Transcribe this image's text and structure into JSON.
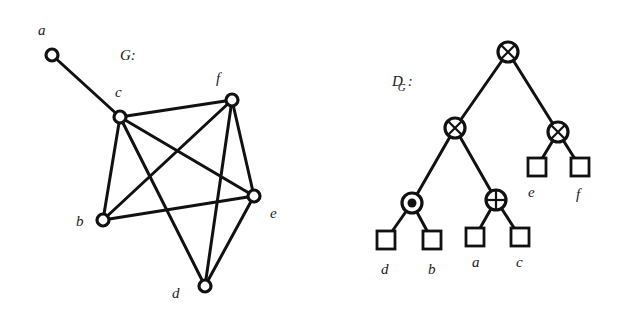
{
  "graph": {
    "title": "G:",
    "vertices": [
      {
        "id": "a",
        "label": "a"
      },
      {
        "id": "b",
        "label": "b"
      },
      {
        "id": "c",
        "label": "c"
      },
      {
        "id": "d",
        "label": "d"
      },
      {
        "id": "e",
        "label": "e"
      },
      {
        "id": "f",
        "label": "f"
      }
    ],
    "edges": [
      [
        "a",
        "c"
      ],
      [
        "c",
        "f"
      ],
      [
        "c",
        "b"
      ],
      [
        "c",
        "e"
      ],
      [
        "c",
        "d"
      ],
      [
        "f",
        "b"
      ],
      [
        "f",
        "d"
      ],
      [
        "f",
        "e"
      ],
      [
        "b",
        "e"
      ],
      [
        "e",
        "d"
      ]
    ]
  },
  "decomposition_tree": {
    "title": "D",
    "title_subscript": "G",
    "title_suffix": ":",
    "nodes": [
      {
        "id": "root",
        "type": "series",
        "icon": "circle-times-icon"
      },
      {
        "id": "left",
        "type": "series",
        "icon": "circle-times-icon"
      },
      {
        "id": "right",
        "type": "series",
        "icon": "circle-times-icon"
      },
      {
        "id": "dot",
        "type": "parallel",
        "icon": "circle-dot-icon"
      },
      {
        "id": "plus",
        "type": "union",
        "icon": "circle-plus-icon"
      },
      {
        "id": "leaf-d",
        "type": "leaf",
        "label": "d"
      },
      {
        "id": "leaf-b",
        "type": "leaf",
        "label": "b"
      },
      {
        "id": "leaf-a",
        "type": "leaf",
        "label": "a"
      },
      {
        "id": "leaf-c",
        "type": "leaf",
        "label": "c"
      },
      {
        "id": "leaf-e",
        "type": "leaf",
        "label": "e"
      },
      {
        "id": "leaf-f",
        "type": "leaf",
        "label": "f"
      }
    ],
    "tree_edges": [
      [
        "root",
        "left"
      ],
      [
        "root",
        "right"
      ],
      [
        "left",
        "dot"
      ],
      [
        "left",
        "plus"
      ],
      [
        "right",
        "leaf-e"
      ],
      [
        "right",
        "leaf-f"
      ],
      [
        "dot",
        "leaf-d"
      ],
      [
        "dot",
        "leaf-b"
      ],
      [
        "plus",
        "leaf-a"
      ],
      [
        "plus",
        "leaf-c"
      ]
    ]
  }
}
